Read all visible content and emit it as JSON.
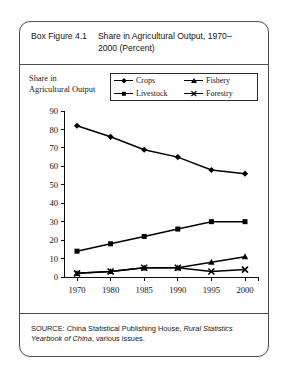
{
  "figure": {
    "label": "Box Figure 4.1",
    "title": "Share in Agricultural Output, 1970–2000 (Percent)",
    "axis_label": "Share in Agricultural Output",
    "source_prefix": "SOURCE: China Statistical Publishing House, ",
    "source_italic": "Rural Statistics Yearbook of China",
    "source_suffix": ", various issues."
  },
  "legend": {
    "items": [
      {
        "label": "Crops",
        "marker": "diamond-marker"
      },
      {
        "label": "Fishery",
        "marker": "triangle-marker"
      },
      {
        "label": "Livestock",
        "marker": "square-marker"
      },
      {
        "label": "Forestry",
        "marker": "x-marker"
      }
    ]
  },
  "chart_data": {
    "type": "line",
    "title": "Share in Agricultural Output, 1970–2000 (Percent)",
    "xlabel": "",
    "ylabel": "Share in Agricultural Output",
    "categories": [
      "1970",
      "1980",
      "1985",
      "1990",
      "1995",
      "2000"
    ],
    "ylim": [
      0,
      90
    ],
    "yticks": [
      0,
      10,
      20,
      30,
      40,
      50,
      60,
      70,
      80,
      90
    ],
    "grid": false,
    "legend_position": "top-right",
    "series": [
      {
        "name": "Crops",
        "marker": "diamond",
        "values": [
          82,
          76,
          69,
          65,
          58,
          56
        ]
      },
      {
        "name": "Livestock",
        "marker": "square",
        "values": [
          14,
          18,
          22,
          26,
          30,
          30
        ]
      },
      {
        "name": "Fishery",
        "marker": "triangle",
        "values": [
          2,
          3,
          5,
          5,
          8,
          11
        ]
      },
      {
        "name": "Forestry",
        "marker": "x",
        "values": [
          2,
          3,
          5,
          5,
          3,
          4
        ]
      }
    ]
  }
}
